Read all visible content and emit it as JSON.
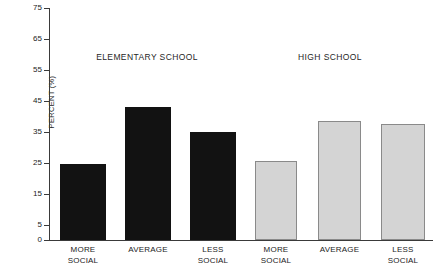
{
  "chart_data": {
    "type": "bar",
    "title": "",
    "xlabel": "",
    "ylabel": "PERCENT (%)",
    "ylim": [
      0,
      75
    ],
    "grid": false,
    "legend": "none",
    "ytick_labels": [
      "75",
      "65",
      "55",
      "45",
      "35",
      "25",
      "15",
      "5",
      "0"
    ],
    "ytick_values": [
      75,
      65,
      55,
      45,
      35,
      25,
      15,
      5,
      0
    ],
    "categories": [
      "MORE SOCIAL",
      "AVERAGE",
      "LESS SOCIAL",
      "MORE SOCIAL",
      "AVERAGE",
      "LESS SOCIAL"
    ],
    "category_lines": [
      [
        "MORE",
        "SOCIAL"
      ],
      [
        "AVERAGE",
        ""
      ],
      [
        "LESS",
        "SOCIAL"
      ],
      [
        "MORE",
        "SOCIAL"
      ],
      [
        "AVERAGE",
        ""
      ],
      [
        "LESS",
        "SOCIAL"
      ]
    ],
    "values": [
      24.5,
      43,
      35,
      25.5,
      38.5,
      37.5
    ],
    "groups": [
      {
        "label": "ELEMENTARY SCHOOL",
        "color": "#121212",
        "categories": [
          "MORE SOCIAL",
          "AVERAGE",
          "LESS SOCIAL"
        ],
        "values": [
          24.5,
          43,
          35
        ]
      },
      {
        "label": "HIGH SCHOOL",
        "color": "#d4d4d4",
        "categories": [
          "MORE SOCIAL",
          "AVERAGE",
          "LESS SOCIAL"
        ],
        "values": [
          25.5,
          38.5,
          37.5
        ]
      }
    ],
    "colors": {
      "elementary_bar": "#121212",
      "highschool_bar": "#d4d4d4",
      "highschool_bar_border": "#8a8a8a",
      "axis": "#3a3a3a",
      "text": "#222222",
      "background": "#ffffff"
    }
  }
}
